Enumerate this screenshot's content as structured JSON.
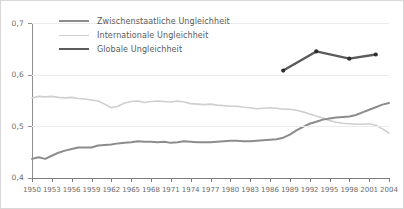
{
  "figure": {
    "background": "#ffffff",
    "border_color": "#d8d8d8",
    "grid_color": "#eceaea",
    "axis_color": "#8e8e8e",
    "tick_label_color": "#6b6b6b"
  },
  "legend": {
    "position": "top-left-inside",
    "items": [
      {
        "label": "Zwischenstaatliche Ungleichheit",
        "color": "#8c8c8c",
        "width": 2.0,
        "icon": "line-swatch-icon"
      },
      {
        "label": "Internationale Ungleichheit",
        "color": "#cfcfcf",
        "width": 1.6,
        "icon": "line-swatch-icon"
      },
      {
        "label": "Globale Ungleichheit",
        "color": "#5b5b5b",
        "width": 2.4,
        "icon": "line-swatch-icon"
      }
    ]
  },
  "chart_data": {
    "type": "line",
    "title": "",
    "subtitle": "",
    "xlabel": "",
    "ylabel": "",
    "xlim": [
      1950,
      2004
    ],
    "ylim": [
      0.4,
      0.7
    ],
    "grid": true,
    "grid_axis": "y",
    "y_ticks": [
      0.4,
      0.5,
      0.6,
      0.7
    ],
    "y_tick_labels": [
      "0,4",
      "0,5",
      "0,6",
      "0,7"
    ],
    "x_ticks": [
      1950,
      1953,
      1956,
      1959,
      1962,
      1965,
      1968,
      1971,
      1974,
      1977,
      1980,
      1983,
      1986,
      1989,
      1992,
      1995,
      1998,
      2001,
      2004
    ],
    "x_tick_labels": [
      "1950",
      "1953",
      "1956",
      "1959",
      "1962",
      "1965",
      "1968",
      "1971",
      "1974",
      "1977",
      "1980",
      "1983",
      "1986",
      "1989",
      "1992",
      "1995",
      "1998",
      "2001",
      "2004"
    ],
    "series": [
      {
        "name": "Internationale Ungleichheit",
        "color": "#cfcfcf",
        "width": 1.6,
        "markers": false,
        "x": [
          1950,
          1951,
          1952,
          1953,
          1954,
          1955,
          1956,
          1957,
          1958,
          1959,
          1960,
          1961,
          1962,
          1963,
          1964,
          1965,
          1966,
          1967,
          1968,
          1969,
          1970,
          1971,
          1972,
          1973,
          1974,
          1975,
          1976,
          1977,
          1978,
          1979,
          1980,
          1981,
          1982,
          1983,
          1984,
          1985,
          1986,
          1987,
          1988,
          1989,
          1990,
          1991,
          1992,
          1993,
          1994,
          1995,
          1996,
          1997,
          1998,
          1999,
          2000,
          2001,
          2002,
          2003,
          2004
        ],
        "y": [
          0.555,
          0.558,
          0.557,
          0.558,
          0.556,
          0.555,
          0.556,
          0.554,
          0.553,
          0.551,
          0.549,
          0.543,
          0.536,
          0.539,
          0.545,
          0.548,
          0.549,
          0.546,
          0.548,
          0.549,
          0.548,
          0.547,
          0.549,
          0.547,
          0.544,
          0.543,
          0.542,
          0.543,
          0.541,
          0.54,
          0.539,
          0.539,
          0.537,
          0.536,
          0.534,
          0.535,
          0.536,
          0.535,
          0.533,
          0.533,
          0.531,
          0.528,
          0.524,
          0.52,
          0.516,
          0.511,
          0.508,
          0.506,
          0.505,
          0.504,
          0.504,
          0.505,
          0.502,
          0.495,
          0.487
        ]
      },
      {
        "name": "Zwischenstaatliche Ungleichheit",
        "color": "#8c8c8c",
        "width": 2.0,
        "markers": false,
        "x": [
          1950,
          1951,
          1952,
          1953,
          1954,
          1955,
          1956,
          1957,
          1958,
          1959,
          1960,
          1961,
          1962,
          1963,
          1964,
          1965,
          1966,
          1967,
          1968,
          1969,
          1970,
          1971,
          1972,
          1973,
          1974,
          1975,
          1976,
          1977,
          1978,
          1979,
          1980,
          1981,
          1982,
          1983,
          1984,
          1985,
          1986,
          1987,
          1988,
          1989,
          1990,
          1991,
          1992,
          1993,
          1994,
          1995,
          1996,
          1997,
          1998,
          1999,
          2000,
          2001,
          2002,
          2003,
          2004
        ],
        "y": [
          0.437,
          0.44,
          0.437,
          0.443,
          0.449,
          0.453,
          0.456,
          0.459,
          0.459,
          0.459,
          0.463,
          0.464,
          0.465,
          0.467,
          0.468,
          0.469,
          0.471,
          0.47,
          0.47,
          0.469,
          0.47,
          0.468,
          0.469,
          0.471,
          0.47,
          0.469,
          0.469,
          0.469,
          0.47,
          0.471,
          0.472,
          0.472,
          0.471,
          0.471,
          0.472,
          0.473,
          0.474,
          0.475,
          0.478,
          0.484,
          0.492,
          0.499,
          0.505,
          0.509,
          0.513,
          0.515,
          0.517,
          0.518,
          0.519,
          0.522,
          0.527,
          0.532,
          0.537,
          0.542,
          0.545
        ]
      },
      {
        "name": "Globale Ungleichheit",
        "color": "#5b5b5b",
        "width": 2.4,
        "markers": true,
        "marker_color": "#2e2e2e",
        "x": [
          1988,
          1993,
          1998,
          2002
        ],
        "y": [
          0.608,
          0.645,
          0.631,
          0.639
        ]
      }
    ]
  }
}
